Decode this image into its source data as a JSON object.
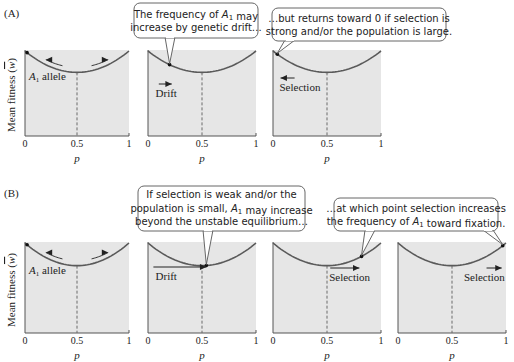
{
  "section_labels": [
    {
      "id": "A",
      "text": "(A)",
      "x": 4,
      "y": 17
    },
    {
      "id": "B",
      "text": "(B)",
      "x": 4,
      "y": 197
    }
  ],
  "ylabel": {
    "text": "Mean fitness (",
    "wbar": "w",
    "close": ")"
  },
  "xlabel": "p",
  "ticks": [
    "0",
    "0.5",
    "1"
  ],
  "colors": {
    "panel_bg": "#e6e6e6",
    "curve": "#5a5a5a",
    "axis": "#555555",
    "dashed": "#6b6b6b",
    "bubble_fill": "#ffffff",
    "bubble_stroke": "#666666",
    "text": "#222222"
  },
  "rows": [
    {
      "id": "A",
      "panel_top": 50,
      "panel_bottom": 136,
      "ylabel_center_y": 95,
      "panels": [
        {
          "x0": 25,
          "x1": 129,
          "dot_p": 0.02,
          "annotation": "A1 allele",
          "show_allele_arrows": true
        },
        {
          "x0": 148,
          "x1": 256,
          "dot_p": 0.2,
          "arrow": {
            "label": "Drift",
            "dir": "right",
            "from_p": 0.1,
            "to_p": 0.22,
            "y_off": 44,
            "label_p": 0.07
          }
        },
        {
          "x0": 273,
          "x1": 381,
          "dot_p": 0.04,
          "arrow": {
            "label": "Selection",
            "dir": "left",
            "from_p": 0.2,
            "to_p": 0.07,
            "y_off": 38,
            "label_p": 0.06
          }
        }
      ]
    },
    {
      "id": "B",
      "panel_top": 242,
      "panel_bottom": 333,
      "ylabel_center_y": 290,
      "panels": [
        {
          "x0": 25,
          "x1": 129,
          "dot_p": 0.02,
          "annotation": "A1 allele",
          "show_allele_arrows": true
        },
        {
          "x0": 148,
          "x1": 256,
          "dot_p": 0.54,
          "arrow": {
            "label": "Drift",
            "dir": "right",
            "from_p": 0.05,
            "to_p": 0.54,
            "y_off": 35,
            "label_p": 0.07,
            "dot_at_end": true
          }
        },
        {
          "x0": 273,
          "x1": 381,
          "dot_p": 0.82,
          "arrow": {
            "label": "Selection",
            "dir": "right",
            "from_p": 0.53,
            "to_p": 0.8,
            "y_off": 36,
            "label_p": 0.52
          }
        },
        {
          "x0": 398,
          "x1": 506,
          "dot_p": 0.97,
          "arrow": {
            "label": "Selection",
            "dir": "right",
            "from_p": 0.82,
            "to_p": 0.96,
            "y_off": 36,
            "label_p": 0.61
          }
        }
      ]
    }
  ],
  "bubbles": [
    {
      "id": "a2",
      "x": 134,
      "y": 3,
      "w": 124,
      "h": 35,
      "lines": [
        "The frequency of A1 may",
        "increase by genetic drift…"
      ],
      "tails": [
        {
          "base_x": 170,
          "tip_panel_row": 0,
          "tip_panel": 1
        }
      ]
    },
    {
      "id": "a3",
      "x": 272,
      "y": 8,
      "w": 174,
      "h": 33,
      "lines": [
        "…but returns toward 0 if selection is",
        "strong and/or the population is large."
      ],
      "tails": [
        {
          "base_x": 290,
          "tip_panel_row": 0,
          "tip_panel": 2
        }
      ]
    },
    {
      "id": "b2",
      "x": 138,
      "y": 186,
      "w": 167,
      "h": 45,
      "lines": [
        "If selection is weak and/or the",
        "population is small, A1 may increase",
        "beyond the unstable equilibrium…"
      ],
      "tails": [
        {
          "base_x": 208,
          "tip_panel_row": 1,
          "tip_panel": 1
        }
      ]
    },
    {
      "id": "b3",
      "x": 334,
      "y": 198,
      "w": 164,
      "h": 33,
      "lines": [
        "…at which point selection increases",
        "the frequency of A1 toward fixation."
      ],
      "tails": [
        {
          "base_x": 370,
          "tip_panel_row": 1,
          "tip_panel": 2
        },
        {
          "base_x": 488,
          "tip_panel_row": 1,
          "tip_panel": 3
        }
      ]
    }
  ]
}
